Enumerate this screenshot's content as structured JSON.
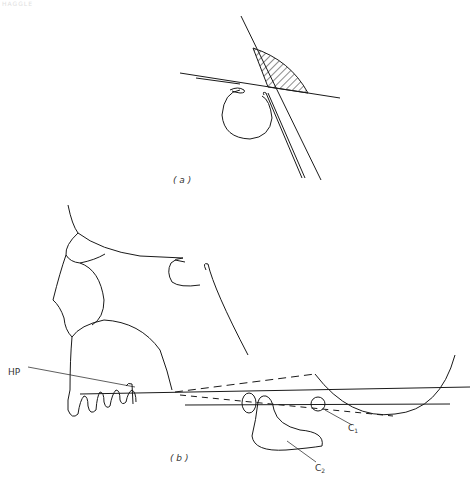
{
  "header": {
    "faint_text": "HAGGLE"
  },
  "figure": {
    "panels": [
      {
        "id": "a",
        "label": "( a )"
      },
      {
        "id": "b",
        "label": "( b )"
      }
    ],
    "annotations": {
      "hp": "HP",
      "c1_main": "C",
      "c1_sub": "1",
      "c2_main": "C",
      "c2_sub": "2"
    },
    "colors": {
      "stroke": "#1a1a1a",
      "background": "#ffffff"
    }
  }
}
